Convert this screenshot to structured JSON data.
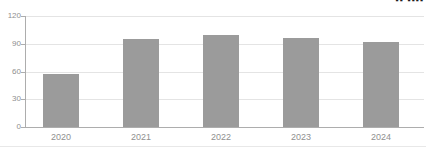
{
  "chart_data": {
    "type": "bar",
    "categories": [
      "2020",
      "2021",
      "2022",
      "2023",
      "2024"
    ],
    "values": [
      57,
      95,
      99,
      96,
      92
    ],
    "title": "",
    "xlabel": "",
    "ylabel": "",
    "ylim": [
      0,
      120
    ],
    "yticks": [
      0,
      30,
      60,
      90,
      120
    ],
    "grid": true,
    "legend": "none",
    "bar_color": "#9b9b9b",
    "grid_color": "#e4e4e4",
    "axis_color": "#adadad",
    "tick_label_color": "#8f8f8f"
  },
  "top_right_fragment": {
    "icon": "clipped-text-fragment",
    "glyph": "▪▪ ▪▪▪▪"
  },
  "layout_colors": {
    "background": "#ffffff",
    "bottom_divider": "#e8e8e8"
  }
}
